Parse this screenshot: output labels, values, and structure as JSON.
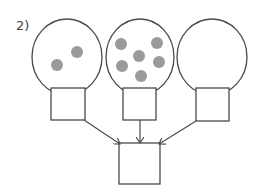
{
  "diagram": {
    "label": "2)",
    "colors": {
      "stroke": "#4a4a4a",
      "dot": "#9a9a9a",
      "background": "#ffffff"
    },
    "balloons": [
      {
        "id": "left",
        "ellipse": {
          "cx": 67,
          "cy": 57,
          "rx": 35,
          "ry": 38
        },
        "box": {
          "x": 51,
          "y": 88,
          "w": 34,
          "h": 32
        },
        "dots": [
          {
            "cx": 77,
            "cy": 52
          },
          {
            "cx": 57,
            "cy": 65
          }
        ]
      },
      {
        "id": "middle",
        "ellipse": {
          "cx": 140,
          "cy": 57,
          "rx": 34,
          "ry": 38
        },
        "box": {
          "x": 123,
          "y": 88,
          "w": 33,
          "h": 32
        },
        "dots": [
          {
            "cx": 121,
            "cy": 44
          },
          {
            "cx": 139,
            "cy": 56
          },
          {
            "cx": 157,
            "cy": 43
          },
          {
            "cx": 122,
            "cy": 66
          },
          {
            "cx": 159,
            "cy": 62
          },
          {
            "cx": 141,
            "cy": 76
          }
        ]
      },
      {
        "id": "right",
        "ellipse": {
          "cx": 212,
          "cy": 57,
          "rx": 35,
          "ry": 38
        },
        "box": {
          "x": 196,
          "y": 88,
          "w": 33,
          "h": 33
        },
        "dots": []
      }
    ],
    "target_box": {
      "x": 119,
      "y": 143,
      "w": 41,
      "h": 41
    },
    "arrows": [
      {
        "from": [
          84,
          120
        ],
        "to": [
          120,
          144
        ]
      },
      {
        "from": [
          140,
          120
        ],
        "to": [
          140,
          143
        ]
      },
      {
        "from": [
          196,
          121
        ],
        "to": [
          159,
          144
        ]
      }
    ]
  }
}
